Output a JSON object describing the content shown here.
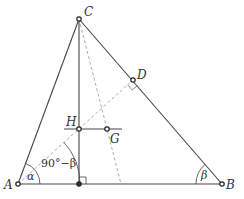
{
  "diagram": {
    "type": "geometry-triangle",
    "colors": {
      "line": "#444444",
      "dashed": "#999999",
      "label": "#333333",
      "point_fill": "#ffffff"
    },
    "points": {
      "A": {
        "label": "A",
        "x": 18,
        "y": 184
      },
      "B": {
        "label": "B",
        "x": 222,
        "y": 184
      },
      "C": {
        "label": "C",
        "x": 79,
        "y": 19
      },
      "D": {
        "label": "D",
        "x": 133,
        "y": 80
      },
      "H": {
        "label": "H",
        "x": 79,
        "y": 129
      },
      "G": {
        "label": "G",
        "x": 107,
        "y": 129
      },
      "F": {
        "label": "",
        "x": 79,
        "y": 184
      }
    },
    "angles": {
      "alpha": "α",
      "beta": "β",
      "complement": "90°−β"
    },
    "labels": {
      "A": "A",
      "B": "B",
      "C": "C",
      "D": "D",
      "H": "H",
      "G": "G"
    }
  }
}
